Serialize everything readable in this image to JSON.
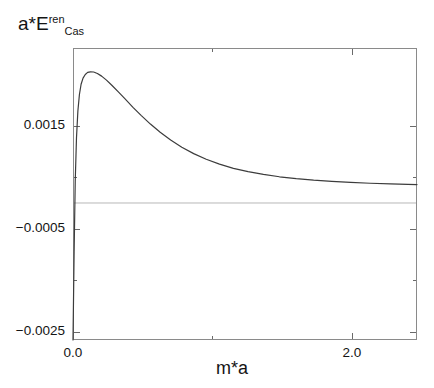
{
  "chart_data": {
    "type": "line",
    "title": "",
    "ylabel": "a*E_Cas^ren",
    "ylabel_base": "a*E",
    "ylabel_sup": "ren",
    "ylabel_sub": "Cas",
    "xlabel": "m*a",
    "xlim": [
      0.0,
      2.466
    ],
    "ylim": [
      -0.002665,
      0.003015
    ],
    "xticks": [
      0.0,
      2.0
    ],
    "xtick_labels": [
      "0.0",
      "2.0"
    ],
    "xminor_ticks": [
      1.0
    ],
    "yticks": [
      0.0015,
      -0.0005,
      -0.0025
    ],
    "ytick_labels": [
      "0.0015",
      "−0.0005",
      "−0.0025"
    ],
    "yminor_ticks": [
      0.0005,
      -0.0015
    ],
    "grid": false,
    "legend": null,
    "reference_lines": [
      {
        "orientation": "horizontal",
        "value": 0.0,
        "color": "#b8b8b8"
      }
    ],
    "line_color": "#3c3c3c",
    "frame_color": "#8a8a8a",
    "series": [
      {
        "name": "renormalized Casimir energy",
        "x": [
          0.0,
          0.008,
          0.016,
          0.025,
          0.035,
          0.046,
          0.058,
          0.072,
          0.088,
          0.105,
          0.125,
          0.148,
          0.175,
          0.205,
          0.24,
          0.28,
          0.325,
          0.375,
          0.43,
          0.49,
          0.555,
          0.625,
          0.7,
          0.78,
          0.865,
          0.955,
          1.05,
          1.15,
          1.255,
          1.365,
          1.48,
          1.6,
          1.725,
          1.855,
          1.99,
          2.13,
          2.275,
          2.4,
          2.466
        ],
        "y": [
          -0.002665,
          -0.00095,
          0.00042,
          0.00127,
          0.00179,
          0.00211,
          0.00231,
          0.00243,
          0.0025,
          0.00254,
          0.002552,
          0.002548,
          0.00252,
          0.002468,
          0.00239,
          0.002285,
          0.00216,
          0.00202,
          0.00186,
          0.0017,
          0.001535,
          0.001375,
          0.001225,
          0.001085,
          0.00096,
          0.00085,
          0.000755,
          0.000675,
          0.00061,
          0.000555,
          0.00051,
          0.000473,
          0.000443,
          0.00042,
          0.0004,
          0.000384,
          0.000371,
          0.000362,
          0.000358
        ]
      }
    ]
  },
  "axis_geometry": {
    "plot_left_px": 73,
    "plot_right_px": 417,
    "plot_top_px": 48,
    "plot_bottom_px": 340
  }
}
